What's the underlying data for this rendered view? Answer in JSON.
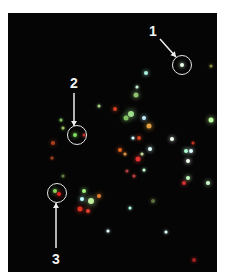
{
  "figure": {
    "background": "#050505",
    "annotations": [
      {
        "label": "1",
        "label_x": 145,
        "label_y": 18,
        "circle_x": 174,
        "circle_y": 52,
        "circle_d": 20,
        "arrow": [
          152,
          26,
          168,
          44
        ]
      },
      {
        "label": "2",
        "label_x": 66,
        "label_y": 70,
        "circle_x": 69,
        "circle_y": 122,
        "circle_d": 20,
        "arrow": [
          66,
          80,
          66,
          113
        ]
      },
      {
        "label": "3",
        "label_x": 48,
        "label_y": 246,
        "circle_x": 49,
        "circle_y": 180,
        "circle_d": 20,
        "arrow": [
          48,
          235,
          48,
          190
        ]
      }
    ],
    "spots": [
      {
        "x": 174,
        "y": 52,
        "c": "#e8ffe8",
        "s": 4
      },
      {
        "x": 138,
        "y": 60,
        "c": "#a8f0e0",
        "s": 4
      },
      {
        "x": 203,
        "y": 53,
        "c": "#8a8a40",
        "s": 3
      },
      {
        "x": 129,
        "y": 74,
        "c": "#c8f0d8",
        "s": 3
      },
      {
        "x": 128,
        "y": 82,
        "c": "#90c070",
        "s": 5
      },
      {
        "x": 91,
        "y": 93,
        "c": "#a0d080",
        "s": 3
      },
      {
        "x": 107,
        "y": 96,
        "c": "#d04020",
        "s": 4
      },
      {
        "x": 123,
        "y": 101,
        "c": "#a0e090",
        "s": 6
      },
      {
        "x": 118,
        "y": 105,
        "c": "#80c060",
        "s": 5
      },
      {
        "x": 136,
        "y": 105,
        "c": "#c0f0ff",
        "s": 4
      },
      {
        "x": 141,
        "y": 113,
        "c": "#e0a040",
        "s": 5
      },
      {
        "x": 203,
        "y": 107,
        "c": "#c0ffa0",
        "s": 5
      },
      {
        "x": 53,
        "y": 107,
        "c": "#80c060",
        "s": 3
      },
      {
        "x": 55,
        "y": 115,
        "c": "#a0c060",
        "s": 3
      },
      {
        "x": 67,
        "y": 122,
        "c": "#80e060",
        "s": 4
      },
      {
        "x": 76,
        "y": 122,
        "c": "#c03030",
        "s": 3
      },
      {
        "x": 45,
        "y": 130,
        "c": "#b04020",
        "s": 4
      },
      {
        "x": 125,
        "y": 125,
        "c": "#d0ffff",
        "s": 3
      },
      {
        "x": 131,
        "y": 125,
        "c": "#d04020",
        "s": 4
      },
      {
        "x": 164,
        "y": 126,
        "c": "#f0fff0",
        "s": 4
      },
      {
        "x": 112,
        "y": 137,
        "c": "#e06020",
        "s": 4
      },
      {
        "x": 142,
        "y": 136,
        "c": "#e0ffff",
        "s": 4
      },
      {
        "x": 117,
        "y": 141,
        "c": "#e09040",
        "s": 3
      },
      {
        "x": 134,
        "y": 141,
        "c": "#c0e0a0",
        "s": 3
      },
      {
        "x": 178,
        "y": 138,
        "c": "#b0ffd0",
        "s": 4
      },
      {
        "x": 183,
        "y": 138,
        "c": "#e0ffff",
        "s": 4
      },
      {
        "x": 185,
        "y": 130,
        "c": "#c03020",
        "s": 3
      },
      {
        "x": 130,
        "y": 146,
        "c": "#e03030",
        "s": 5
      },
      {
        "x": 44,
        "y": 145,
        "c": "#a04020",
        "s": 3
      },
      {
        "x": 180,
        "y": 148,
        "c": "#f0fff0",
        "s": 4
      },
      {
        "x": 119,
        "y": 158,
        "c": "#b04040",
        "s": 3
      },
      {
        "x": 126,
        "y": 163,
        "c": "#c04040",
        "s": 3
      },
      {
        "x": 136,
        "y": 157,
        "c": "#c0ffd0",
        "s": 3
      },
      {
        "x": 180,
        "y": 165,
        "c": "#c0ffc0",
        "s": 4
      },
      {
        "x": 200,
        "y": 170,
        "c": "#d0ffd0",
        "s": 4
      },
      {
        "x": 176,
        "y": 170,
        "c": "#d03030",
        "s": 4
      },
      {
        "x": 55,
        "y": 163,
        "c": "#608040",
        "s": 3
      },
      {
        "x": 47,
        "y": 178,
        "c": "#80e060",
        "s": 4
      },
      {
        "x": 51,
        "y": 181,
        "c": "#e02020",
        "s": 4
      },
      {
        "x": 76,
        "y": 178,
        "c": "#a0f080",
        "s": 4
      },
      {
        "x": 83,
        "y": 188,
        "c": "#c0f0a0",
        "s": 6
      },
      {
        "x": 91,
        "y": 183,
        "c": "#e08030",
        "s": 4
      },
      {
        "x": 74,
        "y": 186,
        "c": "#c0ffff",
        "s": 4
      },
      {
        "x": 72,
        "y": 196,
        "c": "#e03020",
        "s": 5
      },
      {
        "x": 80,
        "y": 198,
        "c": "#e04030",
        "s": 4
      },
      {
        "x": 122,
        "y": 195,
        "c": "#b0ffe0",
        "s": 3
      },
      {
        "x": 145,
        "y": 188,
        "c": "#607040",
        "s": 4
      },
      {
        "x": 100,
        "y": 218,
        "c": "#e0ffff",
        "s": 3
      },
      {
        "x": 158,
        "y": 219,
        "c": "#e0ffff",
        "s": 3
      },
      {
        "x": 186,
        "y": 247,
        "c": "#a02020",
        "s": 4
      }
    ]
  }
}
